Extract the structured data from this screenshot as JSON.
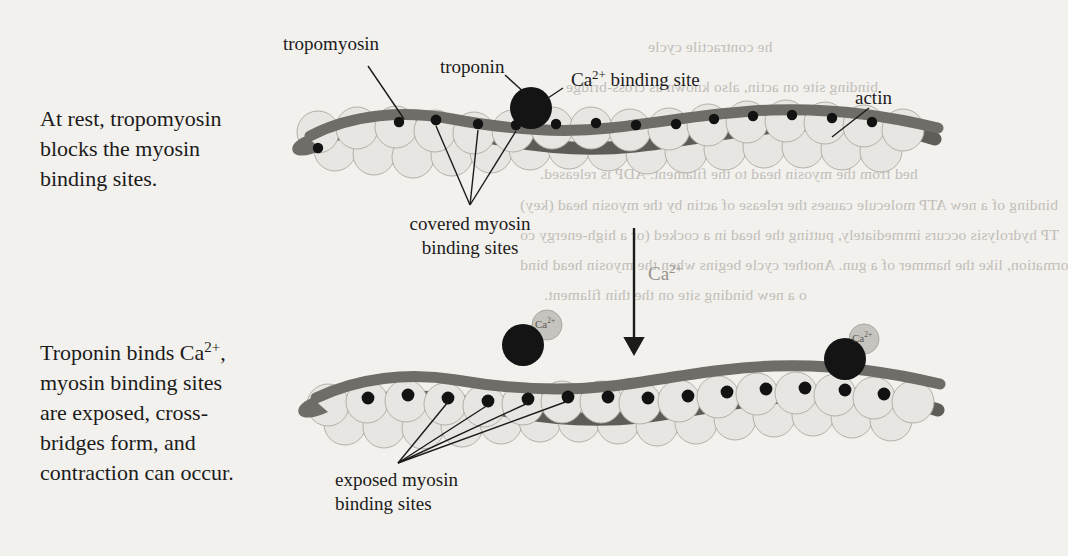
{
  "panels": {
    "rest": {
      "caption_lines": [
        "At rest, tropomyosin",
        "blocks the myosin",
        "binding sites."
      ]
    },
    "active": {
      "caption_lines": [
        "Troponin binds Ca2+,",
        "myosin binding sites",
        "are exposed, cross-",
        "bridges form, and",
        "contraction can occur."
      ],
      "caption_line_1_pre": "Troponin binds Ca",
      "caption_line_1_sup": "2+",
      "caption_line_1_post": ","
    }
  },
  "labels": {
    "tropomyosin": "tropomyosin",
    "troponin": "troponin",
    "ca_binding_site_pre": "Ca",
    "ca_binding_site_sup": "2+",
    "ca_binding_site_post": " binding site",
    "actin": "actin",
    "covered_line1": "covered myosin",
    "covered_line2": "binding sites",
    "exposed_line1": "exposed myosin",
    "exposed_line2": "binding sites",
    "calcium_arrow_pre": "Ca",
    "calcium_arrow_sup": "2+",
    "calcium_chip_pre": "Ca",
    "calcium_chip_sup": "2+"
  },
  "bleed_through": [
    {
      "text": "he contractile cycle",
      "x": 648,
      "y": 38
    },
    {
      "text": "binding site on actin, also known as cross-bridge",
      "x": 566,
      "y": 78
    },
    {
      "text": "orming.",
      "x": 720,
      "y": 110
    },
    {
      "text": "he energy released by the hydrolysis of the p",
      "x": 594,
      "y": 136
    },
    {
      "text": "hed from the myosin head to the filament. ADP is released.",
      "x": 540,
      "y": 165
    },
    {
      "text": "binding of a new ATP molecule causes the release of actin by the myosin head (key)",
      "x": 520,
      "y": 196
    },
    {
      "text": "TP hydrolysis occurs immediately, putting the head in a cocked (or a high-energy co",
      "x": 520,
      "y": 226
    },
    {
      "text": "ormation, like the hammer of a gun. Another cycle begins when the myosin head bind",
      "x": 520,
      "y": 256
    },
    {
      "text": "o a new binding site on the thin filament.",
      "x": 544,
      "y": 286
    }
  ],
  "colors": {
    "page_background": "#f2f1ee",
    "actin_fill": "#e7e6e2",
    "actin_stroke": "#b3b1ab",
    "tropomyosin": "#6e6d68",
    "tropomyosin_dark": "#55544f",
    "binding_site_dot": "#121212",
    "troponin": "#141414",
    "calcium_ion": "#c6c4bf",
    "leader_line": "#1c1b1a",
    "arrow": "#1c1b1a",
    "text": "#1c1b1a",
    "gray_text": "#96938d",
    "bleed_text": "#b9b6b0"
  },
  "chart_data": {
    "type": "diagram",
    "panel_top": {
      "state": "at rest",
      "tropomyosin_position": "covering binding sites",
      "binding_sites_status": "covered",
      "calcium_bound": false,
      "actin_count": 34,
      "binding_site_count": 14,
      "troponin_count": 1
    },
    "panel_bottom": {
      "state": "calcium bound",
      "tropomyosin_position": "shifted away from binding sites",
      "binding_sites_status": "exposed",
      "calcium_bound": true,
      "actin_count": 34,
      "binding_site_count": 14,
      "troponin_count": 2,
      "calcium_ion_count": 2
    },
    "transition": {
      "label": "Ca2+",
      "direction": "downward"
    }
  }
}
